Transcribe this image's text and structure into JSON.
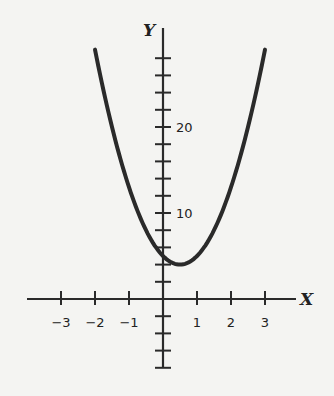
{
  "chart_data": {
    "type": "line",
    "title": "",
    "xlabel": "X",
    "ylabel": "Y",
    "x_ticks": [
      -3,
      -2,
      -1,
      1,
      2,
      3
    ],
    "x_tick_labels": [
      "-3",
      "-2",
      "-1",
      "1",
      "2",
      "3"
    ],
    "y_tick_step": 2,
    "y_tick_labels": [
      "10",
      "20"
    ],
    "y_labeled_ticks": [
      10,
      20
    ],
    "xlim": [
      -3.9,
      4
    ],
    "ylim": [
      -8,
      31
    ],
    "grid": false,
    "series": [
      {
        "name": "parabola",
        "equation_estimate": "y = 4x^2 - 4x + 5",
        "x": [
          -2,
          -1.5,
          -1,
          -0.5,
          0,
          0.5,
          1,
          1.5,
          2,
          2.5,
          3
        ],
        "y": [
          29,
          20,
          13,
          8,
          5,
          4,
          5,
          8,
          13,
          20,
          29
        ]
      }
    ],
    "colors": {
      "curve": "#2a2a2a",
      "axes": "#2a2a2a",
      "background": "#f4f4f2"
    }
  }
}
